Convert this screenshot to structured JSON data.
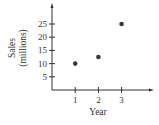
{
  "chart_data": {
    "type": "scatter",
    "title": "",
    "xlabel": "Year",
    "ylabel": "Sales (millions)",
    "ylabel_lines": [
      "Sales",
      "(millions)"
    ],
    "x": [
      1,
      2,
      3
    ],
    "y": [
      10,
      12.5,
      25
    ],
    "x_ticks": [
      1,
      2,
      3
    ],
    "y_ticks": [
      5,
      10,
      15,
      20,
      25
    ],
    "xlim": [
      0,
      4
    ],
    "ylim": [
      0,
      30
    ],
    "grid": false,
    "legend": null,
    "colors": {
      "axis": "#333333",
      "point": "#3a3a3a",
      "text": "#333333"
    }
  }
}
